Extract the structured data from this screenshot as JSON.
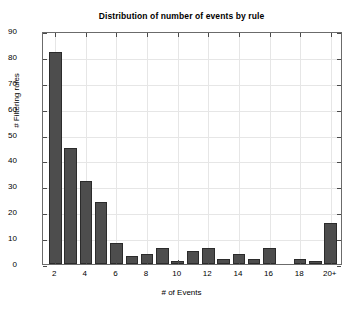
{
  "chart_data": {
    "type": "bar",
    "title": "Distribution of number of events by rule",
    "xlabel": "# of Events",
    "ylabel": "# Filtering rules",
    "categories": [
      "2",
      "3",
      "4",
      "5",
      "6",
      "7",
      "8",
      "9",
      "10",
      "11",
      "12",
      "13",
      "14",
      "15",
      "16",
      "17",
      "18",
      "19",
      "20+"
    ],
    "values": [
      82,
      45,
      32,
      24,
      8,
      3,
      4,
      6,
      1,
      5,
      6,
      2,
      4,
      2,
      6,
      0,
      2,
      1,
      16
    ],
    "xtick_labels": [
      "2",
      "4",
      "6",
      "8",
      "10",
      "12",
      "14",
      "16",
      "18",
      "20+"
    ],
    "xtick_positions": [
      2,
      4,
      6,
      8,
      10,
      12,
      14,
      16,
      18,
      20
    ],
    "ytick_labels": [
      "0",
      "10",
      "20",
      "30",
      "40",
      "50",
      "60",
      "70",
      "80",
      "90"
    ],
    "ytick_values": [
      0,
      10,
      20,
      30,
      40,
      50,
      60,
      70,
      80,
      90
    ],
    "ylim": [
      0,
      90
    ],
    "xlim": [
      1.2,
      20.8
    ],
    "grid": true,
    "legend": null,
    "bar_color": "#4d4d4d",
    "bar_edge_color": "#2b2b2b",
    "grid_color": "#e6e6e6",
    "axis_color": "#6b6b6b",
    "background_color": "#ffffff"
  }
}
